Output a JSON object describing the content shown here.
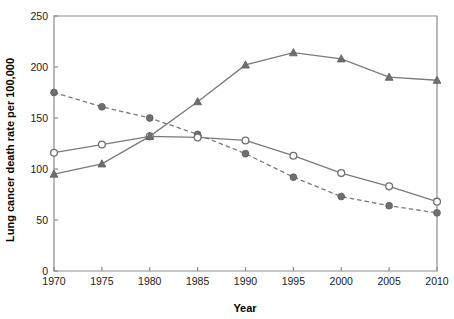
{
  "chart_data": {
    "type": "line",
    "title": "",
    "xlabel": "Year",
    "ylabel": "Lung cancer death rate per 100,000",
    "x": [
      1970,
      1975,
      1980,
      1985,
      1990,
      1995,
      2000,
      2005,
      2010
    ],
    "xticklabels": [
      "1970",
      "1975",
      "1980",
      "1985",
      "1990",
      "1995",
      "2000",
      "2005",
      "2010"
    ],
    "yticklabels": [
      "0",
      "50",
      "100",
      "150",
      "200",
      "250"
    ],
    "yticks": [
      0,
      50,
      100,
      150,
      200,
      250
    ],
    "xlim": [
      1970,
      2010
    ],
    "ylim": [
      0,
      250
    ],
    "grid": false,
    "legend": "none",
    "series": [
      {
        "name": "series-filled-circle-dashed",
        "marker": "filled-circle",
        "linestyle": "dashed",
        "color": "#6f6f6f",
        "values": [
          175,
          161,
          150,
          134,
          115,
          92,
          73,
          64,
          57
        ]
      },
      {
        "name": "series-open-circle-solid",
        "marker": "open-circle",
        "linestyle": "solid",
        "color": "#6f6f6f",
        "values": [
          116,
          124,
          132,
          131,
          128,
          113,
          96,
          83,
          68
        ]
      },
      {
        "name": "series-triangle-solid",
        "marker": "triangle",
        "linestyle": "solid",
        "color": "#6f6f6f",
        "values": [
          95,
          105,
          132,
          166,
          202,
          214,
          208,
          190,
          187
        ]
      }
    ]
  },
  "colors": {
    "axis": "#8c8c8c",
    "marker": "#6f6f6f",
    "line": "#7a7a7a",
    "text": "#1a1a1a",
    "background": "#ffffff"
  }
}
